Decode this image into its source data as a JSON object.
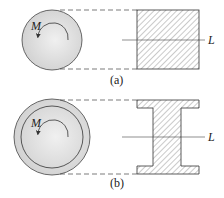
{
  "figure": {
    "panels": [
      {
        "id": "a",
        "caption": "(a)",
        "moment_label": "M",
        "line_label": "L",
        "section": "solid-square",
        "shaft": "solid-circle"
      },
      {
        "id": "b",
        "caption": "(b)",
        "moment_label": "M",
        "line_label": "L",
        "section": "i-beam",
        "shaft": "hollow-circle"
      }
    ],
    "colors": {
      "stroke": "#333333",
      "shaft_fill": "#d9d9d9",
      "hatch": "#555555"
    }
  }
}
